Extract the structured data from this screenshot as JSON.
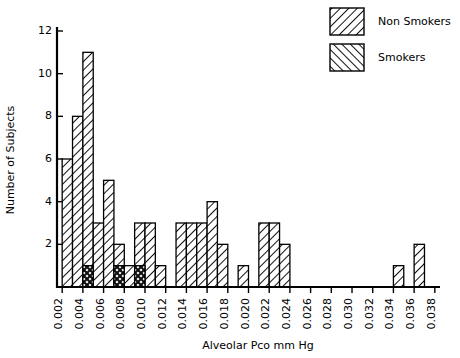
{
  "chart_data": {
    "type": "bar",
    "title": "",
    "subtitle": "",
    "xlabel": "Alveolar Pco mm Hg",
    "ylabel": "Number of Subjects",
    "xlim": [
      0.0015,
      0.0385
    ],
    "ylim": [
      0,
      12
    ],
    "grid": false,
    "bin_width": 0.001,
    "overlap_style": "overlaid-crosshatch",
    "legend_position": "top-right",
    "x_tick_labels": [
      "0.002",
      "0.004",
      "0.006",
      "0.008",
      "0.010",
      "0.012",
      "0.014",
      "0.016",
      "0.018",
      "0.020",
      "0.022",
      "0.024",
      "0.026",
      "0.028",
      "0.030",
      "0.032",
      "0.034",
      "0.036",
      "0.038"
    ],
    "x_tick_values": [
      0.002,
      0.004,
      0.006,
      0.008,
      0.01,
      0.012,
      0.014,
      0.016,
      0.018,
      0.02,
      0.022,
      0.024,
      0.026,
      0.028,
      0.03,
      0.032,
      0.034,
      0.036,
      0.038
    ],
    "y_tick_labels": [
      "2",
      "4",
      "6",
      "8",
      "10",
      "12"
    ],
    "y_tick_values": [
      2,
      4,
      6,
      8,
      10,
      12
    ],
    "categories": [
      0.002,
      0.003,
      0.004,
      0.005,
      0.006,
      0.007,
      0.008,
      0.009,
      0.01,
      0.011,
      0.012,
      0.013,
      0.014,
      0.015,
      0.016,
      0.017,
      0.018,
      0.019,
      0.02,
      0.021,
      0.022,
      0.023,
      0.024,
      0.025,
      0.026,
      0.027,
      0.028,
      0.029,
      0.03,
      0.031,
      0.032,
      0.033,
      0.034,
      0.035,
      0.036,
      0.037
    ],
    "series": [
      {
        "name": "Non Smokers",
        "hatch": "forward-slash",
        "values": [
          6,
          8,
          11,
          3,
          5,
          2,
          1,
          3,
          3,
          1,
          0,
          3,
          3,
          3,
          4,
          2,
          0,
          1,
          0,
          3,
          3,
          2,
          0,
          0,
          0,
          0,
          0,
          0,
          0,
          0,
          0,
          0,
          1,
          0,
          2,
          0
        ]
      },
      {
        "name": "Smokers",
        "hatch": "backslash",
        "values": [
          0,
          0,
          1,
          0,
          0,
          1,
          0,
          1,
          0,
          0,
          0,
          0,
          0,
          0,
          0,
          0,
          0,
          0,
          0,
          0,
          0,
          0,
          0,
          0,
          0,
          0,
          0,
          0,
          0,
          0,
          0,
          0,
          0,
          0,
          0,
          0
        ]
      }
    ]
  },
  "legend": {
    "entries": [
      {
        "label": "Non Smokers",
        "swatch": "forward-slash-hatch-swatch"
      },
      {
        "label": "Smokers",
        "swatch": "backslash-hatch-swatch"
      }
    ]
  },
  "colors": {
    "ink": "#000000",
    "background": "#ffffff"
  }
}
